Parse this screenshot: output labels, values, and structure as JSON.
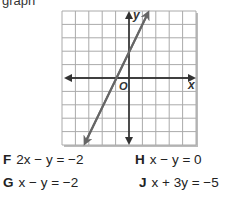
{
  "question": {
    "partial_text": "graph"
  },
  "graph": {
    "x_axis_label": "x",
    "y_axis_label": "y",
    "origin_label": "O",
    "grid": {
      "x_min": -5,
      "x_max": 5,
      "y_min": -5,
      "y_max": 5
    },
    "line": {
      "slope": 2,
      "intercept": 2,
      "points": [
        [
          -1,
          0
        ],
        [
          0,
          2
        ]
      ]
    }
  },
  "choices": [
    {
      "letter": "F",
      "equation": "2x − y = −2"
    },
    {
      "letter": "G",
      "equation": "x − y = −2"
    },
    {
      "letter": "H",
      "equation": "x − y = 0"
    },
    {
      "letter": "J",
      "equation": "x + 3y = −5"
    }
  ]
}
